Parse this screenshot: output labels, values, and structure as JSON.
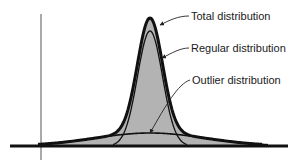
{
  "diagram": {
    "title": "",
    "labels": {
      "total": "Total distribution",
      "regular": "Regular distribution",
      "outlier": "Outlier distribution"
    },
    "curves": [
      {
        "name": "total",
        "description": "sum of regular and outlier distributions",
        "style": "thick"
      },
      {
        "name": "regular",
        "description": "narrow tall bell curve",
        "style": "thin"
      },
      {
        "name": "outlier",
        "description": "wide flat bell curve",
        "style": "medium"
      }
    ],
    "colors": {
      "fill": "#b3b3b3",
      "stroke": "#111111",
      "axis": "#555555"
    }
  }
}
